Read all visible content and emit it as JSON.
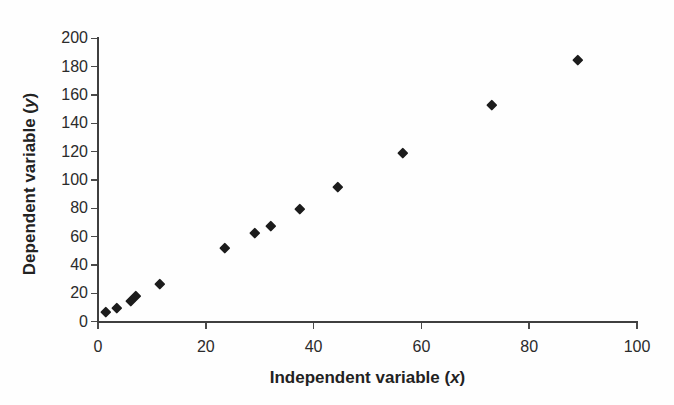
{
  "figure": {
    "background": "#fefefe",
    "text_color": "#2b2b2b",
    "axis_color": "#3f3f3f",
    "marker_color": "#1c1c1c"
  },
  "chart_data": {
    "type": "scatter",
    "title": "",
    "xlabel": {
      "prefix": "Independent variable (",
      "variable": "x",
      "suffix": ")"
    },
    "ylabel": {
      "prefix": "Dependent variable (",
      "variable": "y",
      "suffix": ")"
    },
    "xlim": [
      0,
      100
    ],
    "ylim": [
      0,
      200
    ],
    "x_ticks": [
      0,
      20,
      40,
      60,
      80,
      100
    ],
    "y_ticks": [
      0,
      20,
      40,
      60,
      80,
      100,
      120,
      140,
      160,
      180,
      200
    ],
    "grid": false,
    "legend": "none",
    "marker": "diamond",
    "points": [
      [
        1.5,
        7
      ],
      [
        3.5,
        10
      ],
      [
        6,
        15
      ],
      [
        7,
        18
      ],
      [
        11.5,
        27
      ],
      [
        23.5,
        52
      ],
      [
        29,
        63
      ],
      [
        32,
        68
      ],
      [
        37.5,
        80
      ],
      [
        44.5,
        95
      ],
      [
        56.5,
        119
      ],
      [
        73,
        153
      ],
      [
        89,
        185
      ]
    ]
  }
}
